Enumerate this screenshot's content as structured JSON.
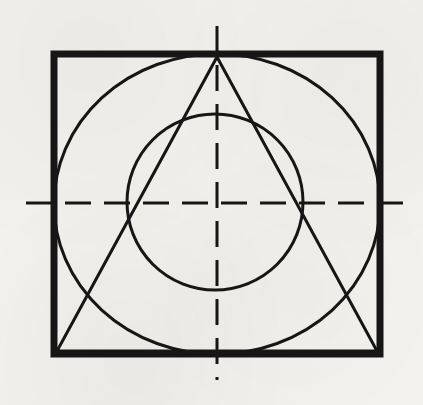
{
  "figure": {
    "canvas": {
      "width": 423,
      "height": 405
    },
    "background_color": "#f4f2ee",
    "ink_color": "#161616"
  },
  "shapes": {
    "rectangle": {
      "name": "outer-rectangle",
      "x": 54,
      "y": 54,
      "width": 326,
      "height": 300,
      "stroke_width": 7,
      "stroke_color": "#161616",
      "fill": "none"
    },
    "outer_ellipse": {
      "name": "inscribed-ellipse",
      "cx": 217,
      "cy": 204,
      "rx": 163,
      "ry": 150,
      "stroke_width": 3,
      "stroke_color": "#161616",
      "fill": "none"
    },
    "inner_circle": {
      "name": "inner-circle",
      "cx": 215,
      "cy": 202,
      "r": 88,
      "stroke_width": 3,
      "stroke_color": "#161616",
      "fill": "none"
    },
    "triangle": {
      "name": "inscribed-triangle",
      "points": "217,57 377,351 57,351",
      "apex": {
        "x": 217,
        "y": 57
      },
      "base_left": {
        "x": 57,
        "y": 351
      },
      "base_right": {
        "x": 377,
        "y": 351
      },
      "stroke_width": 3,
      "stroke_color": "#161616",
      "fill": "none"
    }
  },
  "center_lines": {
    "horizontal": {
      "name": "horizontal-center-line",
      "x1": 26,
      "y1": 203,
      "x2": 408,
      "y2": 203,
      "stroke_width": 3,
      "stroke_color": "#161616",
      "dash_pattern": "26 13"
    },
    "vertical": {
      "name": "vertical-center-line",
      "x1": 217,
      "y1": 26,
      "x2": 217,
      "y2": 380,
      "stroke_width": 3,
      "stroke_color": "#161616",
      "dash_pattern": "26 13"
    }
  }
}
